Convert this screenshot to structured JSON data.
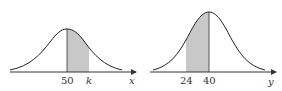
{
  "diagram": {
    "left": {
      "axis_label": "x",
      "mean_label": "50",
      "bound_label": "k",
      "shaded_from": "50",
      "shaded_to": "k"
    },
    "right": {
      "axis_label": "y",
      "mean_label": "40",
      "bound_label": "24",
      "shaded_from": "24",
      "shaded_to": "40"
    },
    "colors": {
      "curve": "#222222",
      "axis": "#333333",
      "shade": "#c8c8c8"
    }
  }
}
